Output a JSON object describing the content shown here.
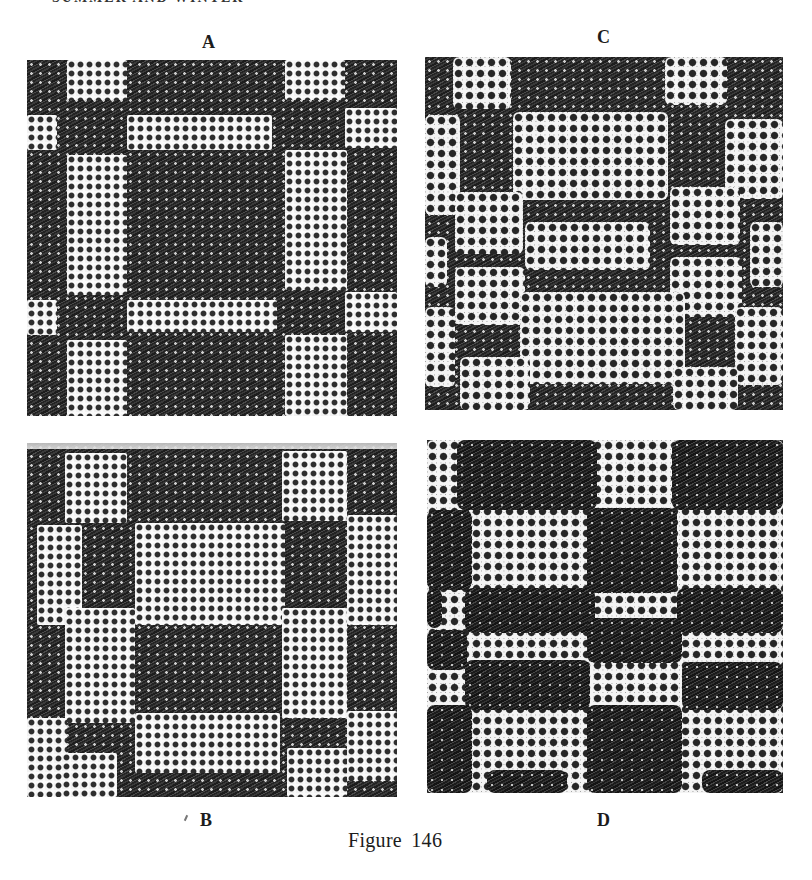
{
  "page": {
    "running_head": "SUMMER AND WINTER",
    "running_head_note": "cropped at top edge; only lower fragments of letters visible"
  },
  "figure": {
    "caption": "Figure 146",
    "panels": [
      {
        "id": "A",
        "label": "A",
        "label_pos": {
          "x": 202,
          "y": 33
        },
        "rect": {
          "x": 27,
          "y": 60,
          "w": 370,
          "h": 356
        },
        "top_band": false,
        "description": "Light grid bands forming a window-pane / checker pattern over dark diagonal weft-float ground",
        "blocks": [
          {
            "t": "light",
            "x": 40,
            "y": 0,
            "w": 60,
            "h": 40
          },
          {
            "t": "light",
            "x": 258,
            "y": 0,
            "w": 60,
            "h": 40
          },
          {
            "t": "light",
            "x": 0,
            "y": 55,
            "w": 30,
            "h": 35
          },
          {
            "t": "light",
            "x": 100,
            "y": 55,
            "w": 145,
            "h": 35
          },
          {
            "t": "light",
            "x": 318,
            "y": 48,
            "w": 52,
            "h": 40
          },
          {
            "t": "light",
            "x": 40,
            "y": 95,
            "w": 60,
            "h": 140
          },
          {
            "t": "light",
            "x": 258,
            "y": 90,
            "w": 62,
            "h": 140
          },
          {
            "t": "light",
            "x": 0,
            "y": 240,
            "w": 30,
            "h": 35
          },
          {
            "t": "light",
            "x": 100,
            "y": 240,
            "w": 150,
            "h": 32
          },
          {
            "t": "light",
            "x": 318,
            "y": 232,
            "w": 52,
            "h": 40
          },
          {
            "t": "light",
            "x": 40,
            "y": 280,
            "w": 60,
            "h": 76
          },
          {
            "t": "light",
            "x": 258,
            "y": 275,
            "w": 62,
            "h": 81
          }
        ]
      },
      {
        "id": "C",
        "label": "C",
        "label_pos": {
          "x": 597,
          "y": 28
        },
        "rect": {
          "x": 425,
          "y": 57,
          "w": 358,
          "h": 353
        },
        "top_band": false,
        "description": "Oval lacy light areas separated by dark diagonal lattice bands",
        "blocks": [
          {
            "t": "lighter",
            "x": 28,
            "y": 0,
            "w": 58,
            "h": 52
          },
          {
            "t": "lighter",
            "x": 240,
            "y": 0,
            "w": 62,
            "h": 48
          },
          {
            "t": "lighter",
            "x": 0,
            "y": 58,
            "w": 35,
            "h": 100
          },
          {
            "t": "lighter",
            "x": 88,
            "y": 55,
            "w": 155,
            "h": 88
          },
          {
            "t": "lighter",
            "x": 300,
            "y": 62,
            "w": 58,
            "h": 80
          },
          {
            "t": "lighter",
            "x": 30,
            "y": 135,
            "w": 68,
            "h": 62
          },
          {
            "t": "lighter",
            "x": 245,
            "y": 130,
            "w": 70,
            "h": 58
          },
          {
            "t": "lighter",
            "x": 100,
            "y": 165,
            "w": 125,
            "h": 48
          },
          {
            "t": "lighter",
            "x": 0,
            "y": 180,
            "w": 22,
            "h": 50
          },
          {
            "t": "lighter",
            "x": 325,
            "y": 165,
            "w": 33,
            "h": 65
          },
          {
            "t": "lighter",
            "x": 30,
            "y": 210,
            "w": 70,
            "h": 58
          },
          {
            "t": "lighter",
            "x": 245,
            "y": 200,
            "w": 72,
            "h": 60
          },
          {
            "t": "lighter",
            "x": 0,
            "y": 250,
            "w": 30,
            "h": 80
          },
          {
            "t": "lighter",
            "x": 95,
            "y": 235,
            "w": 165,
            "h": 92
          },
          {
            "t": "lighter",
            "x": 310,
            "y": 250,
            "w": 48,
            "h": 78
          },
          {
            "t": "lighter",
            "x": 35,
            "y": 300,
            "w": 70,
            "h": 53
          },
          {
            "t": "lighter",
            "x": 248,
            "y": 310,
            "w": 65,
            "h": 43
          }
        ]
      },
      {
        "id": "B",
        "label": "B",
        "label_pos": {
          "x": 200,
          "y": 811
        },
        "rect": {
          "x": 27,
          "y": 443,
          "w": 370,
          "h": 354
        },
        "top_band": true,
        "description": "Large light blocks in diagonal/staggered arrangement with dark diagonal bands",
        "blocks": [
          {
            "t": "light",
            "x": 38,
            "y": 10,
            "w": 62,
            "h": 70
          },
          {
            "t": "light",
            "x": 255,
            "y": 8,
            "w": 65,
            "h": 70
          },
          {
            "t": "light",
            "x": 10,
            "y": 82,
            "w": 45,
            "h": 100
          },
          {
            "t": "light",
            "x": 108,
            "y": 80,
            "w": 150,
            "h": 102
          },
          {
            "t": "light",
            "x": 320,
            "y": 72,
            "w": 50,
            "h": 110
          },
          {
            "t": "light",
            "x": 38,
            "y": 165,
            "w": 70,
            "h": 115
          },
          {
            "t": "light",
            "x": 255,
            "y": 165,
            "w": 65,
            "h": 110
          },
          {
            "t": "light",
            "x": 0,
            "y": 275,
            "w": 40,
            "h": 79
          },
          {
            "t": "light",
            "x": 108,
            "y": 270,
            "w": 145,
            "h": 60
          },
          {
            "t": "light",
            "x": 320,
            "y": 268,
            "w": 50,
            "h": 70
          },
          {
            "t": "light",
            "x": 35,
            "y": 310,
            "w": 55,
            "h": 44
          },
          {
            "t": "light",
            "x": 260,
            "y": 305,
            "w": 60,
            "h": 49
          }
        ]
      },
      {
        "id": "D",
        "label": "D",
        "label_pos": {
          "x": 597,
          "y": 811
        },
        "rect": {
          "x": 427,
          "y": 440,
          "w": 356,
          "h": 353
        },
        "top_band": false,
        "description": "Dense dark rounded blocks on lacy white ground in checkerboard arrangement",
        "blocks": [
          {
            "t": "lighter",
            "x": 0,
            "y": 0,
            "w": 356,
            "h": 353
          },
          {
            "t": "dark",
            "x": 30,
            "y": 0,
            "w": 140,
            "h": 70
          },
          {
            "t": "dark",
            "x": 245,
            "y": 0,
            "w": 111,
            "h": 70
          },
          {
            "t": "dark",
            "x": 0,
            "y": 70,
            "w": 45,
            "h": 80
          },
          {
            "t": "dark",
            "x": 160,
            "y": 68,
            "w": 90,
            "h": 85
          },
          {
            "t": "dark",
            "x": 0,
            "y": 148,
            "w": 15,
            "h": 40
          },
          {
            "t": "dark",
            "x": 38,
            "y": 148,
            "w": 130,
            "h": 45
          },
          {
            "t": "dark",
            "x": 250,
            "y": 148,
            "w": 106,
            "h": 45
          },
          {
            "t": "dark",
            "x": 0,
            "y": 190,
            "w": 40,
            "h": 40
          },
          {
            "t": "dark",
            "x": 160,
            "y": 178,
            "w": 95,
            "h": 45
          },
          {
            "t": "dark",
            "x": 38,
            "y": 220,
            "w": 125,
            "h": 50
          },
          {
            "t": "dark",
            "x": 255,
            "y": 222,
            "w": 101,
            "h": 48
          },
          {
            "t": "dark",
            "x": 0,
            "y": 265,
            "w": 45,
            "h": 88
          },
          {
            "t": "dark",
            "x": 160,
            "y": 265,
            "w": 95,
            "h": 88
          },
          {
            "t": "dark",
            "x": 60,
            "y": 330,
            "w": 80,
            "h": 23
          },
          {
            "t": "dark",
            "x": 275,
            "y": 330,
            "w": 81,
            "h": 23
          }
        ]
      }
    ]
  }
}
